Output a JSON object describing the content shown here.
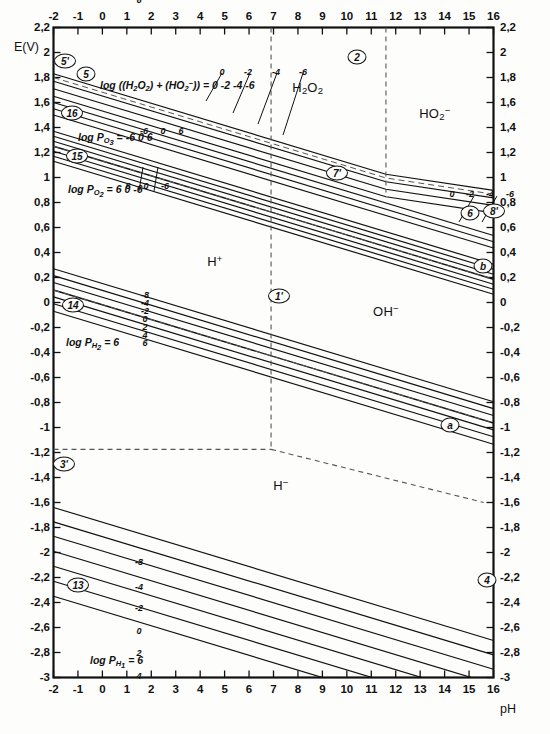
{
  "figure": {
    "kind": "pourbaix-diagram",
    "title": "",
    "background": "#fdfdfc",
    "line_color": "#111111",
    "dash_color": "#555555"
  },
  "axes": {
    "x": {
      "label": "pH",
      "min": -2,
      "max": 16,
      "ticks": [
        "-2",
        "-1",
        "0",
        "1",
        "2",
        "3",
        "4",
        "5",
        "6",
        "7",
        "8",
        "9",
        "10",
        "11",
        "12",
        "13",
        "14",
        "15",
        "16"
      ],
      "tick_values": [
        -2,
        -1,
        0,
        1,
        2,
        3,
        4,
        5,
        6,
        7,
        8,
        9,
        10,
        11,
        12,
        13,
        14,
        15,
        16
      ],
      "top_ticks": [
        "-2",
        "-1",
        "0",
        "1",
        "2",
        "3",
        "4",
        "5",
        "6",
        "7",
        "8",
        "9",
        "10",
        "11",
        "12",
        "13",
        "14",
        "15",
        "16"
      ]
    },
    "y": {
      "label": "E(V)",
      "min": -3,
      "max": 2.2,
      "ticks": [
        "2,2",
        "2",
        "1,8",
        "1,6",
        "1,4",
        "1,2",
        "1",
        "0,8",
        "0,6",
        "0,4",
        "0,2",
        "0",
        "-0,2",
        "-0,4",
        "-0,6",
        "-0,8",
        "-1",
        "-1,2",
        "-1,4",
        "-1,6",
        "-1,8",
        "-2",
        "-2,2",
        "-2,4",
        "-2,6",
        "-2,8",
        "-3"
      ],
      "tick_values": [
        2.2,
        2.0,
        1.8,
        1.6,
        1.4,
        1.2,
        1.0,
        0.8,
        0.6,
        0.4,
        0.2,
        0.0,
        -0.2,
        -0.4,
        -0.6,
        -0.8,
        -1.0,
        -1.2,
        -1.4,
        -1.6,
        -1.8,
        -2.0,
        -2.2,
        -2.4,
        -2.6,
        -2.8,
        -3.0
      ]
    }
  },
  "species_labels": [
    {
      "id": "h2o2",
      "html": "H<sub>2</sub>O<sub>2</sub>",
      "ph": 8.4,
      "e": 1.72
    },
    {
      "id": "ho2m",
      "html": "HO<sub>2</sub><sup>&minus;</sup>",
      "ph": 13.6,
      "e": 1.52
    },
    {
      "id": "hplus",
      "html": "H<sup>+</sup>",
      "ph": 4.6,
      "e": 0.33
    },
    {
      "id": "ohm",
      "html": "OH<sup>&minus;</sup>",
      "ph": 11.6,
      "e": -0.07
    },
    {
      "id": "hminus",
      "html": "H<sup>&minus;</sup>",
      "ph": 7.3,
      "e": -1.46
    }
  ],
  "curve_labels": [
    {
      "id": "log-h2o2-sum",
      "html": "log ((H<sub>2</sub>O<sub>2</sub>) + (HO<sub>2</sub><sup>&minus;</sup>)) = 0 -2 -4 -6",
      "x": 100,
      "y": 80
    },
    {
      "id": "log-po3",
      "html": "log P<sub>O<sub>3</sub></sub> = -6  0  6",
      "x": 78,
      "y": 132
    },
    {
      "id": "log-po2",
      "html": "log P<sub>O<sub>2</sub></sub> = 6  0  -6",
      "x": 68,
      "y": 184
    },
    {
      "id": "log-ph2",
      "html": "log P<sub>H<sub>2</sub></sub> = 6",
      "x": 66,
      "y": 337
    },
    {
      "id": "log-ph1",
      "html": "log P<sub>H<sub>1</sub></sub> = 6",
      "x": 90,
      "y": 655
    }
  ],
  "series_value_labels": {
    "h2o2_sum": [
      "0",
      "-2",
      "-4",
      "-6"
    ],
    "ho2_right": [
      "0",
      "-2",
      "-4",
      "-6"
    ],
    "po3": [
      "-6",
      "0",
      "6"
    ],
    "po2": [
      "6",
      "0",
      "-6"
    ],
    "ph2_stack": [
      "-8",
      "-4",
      "-2",
      "0",
      "2",
      "4",
      "6"
    ],
    "ph1_stack": [
      "-8",
      "-4",
      "-2",
      "0",
      "2",
      "4",
      "6"
    ]
  },
  "badges": [
    {
      "id": "b5p",
      "text": "5'",
      "x": 65,
      "y": 61
    },
    {
      "id": "b5",
      "text": "5",
      "x": 86,
      "y": 74
    },
    {
      "id": "b16",
      "text": "16",
      "x": 72,
      "y": 113
    },
    {
      "id": "b15",
      "text": "15",
      "x": 77,
      "y": 156
    },
    {
      "id": "b2",
      "text": "2",
      "x": 357,
      "y": 57
    },
    {
      "id": "b7p",
      "text": "7'",
      "x": 337,
      "y": 173
    },
    {
      "id": "b6",
      "text": "6",
      "x": 470,
      "y": 213
    },
    {
      "id": "b8p",
      "text": "8'",
      "x": 494,
      "y": 211
    },
    {
      "id": "bb",
      "text": "b",
      "x": 483,
      "y": 266
    },
    {
      "id": "b1p",
      "text": "1'",
      "x": 279,
      "y": 296
    },
    {
      "id": "b14",
      "text": "14",
      "x": 73,
      "y": 305
    },
    {
      "id": "ba",
      "text": "a",
      "x": 450,
      "y": 425
    },
    {
      "id": "b3p",
      "text": "3'",
      "x": 64,
      "y": 464
    },
    {
      "id": "b4",
      "text": "4",
      "x": 487,
      "y": 580
    },
    {
      "id": "b13",
      "text": "13",
      "x": 78,
      "y": 585
    }
  ],
  "chart_data": {
    "type": "line",
    "xlabel": "pH",
    "ylabel": "E(V)",
    "xlim": [
      -2,
      16
    ],
    "ylim": [
      -3,
      2.2
    ],
    "grid": false,
    "legend": "none",
    "slope_per_pH_main": -0.0591,
    "series": [
      {
        "name": "log((H2O2)+(HO2-)) = 0",
        "group": "h2o2_sum",
        "value": 0,
        "E_at_pH_minus2": 1.83,
        "slope": -0.0591,
        "kink_pH": 11.6,
        "slope_after": -0.0295
      },
      {
        "name": "log((H2O2)+(HO2-)) = -2",
        "group": "h2o2_sum",
        "value": -2,
        "E_at_pH_minus2": 1.77,
        "slope": -0.0591,
        "kink_pH": 11.6,
        "slope_after": -0.0295
      },
      {
        "name": "log((H2O2)+(HO2-)) = -4",
        "group": "h2o2_sum",
        "value": -4,
        "E_at_pH_minus2": 1.71,
        "slope": -0.0591,
        "kink_pH": 11.6,
        "slope_after": -0.0295
      },
      {
        "name": "log((H2O2)+(HO2-)) = -6",
        "group": "h2o2_sum",
        "value": -6,
        "E_at_pH_minus2": 1.65,
        "slope": -0.0591,
        "kink_pH": 11.6,
        "slope_after": -0.0295
      },
      {
        "name": "log PO3 = -6",
        "group": "po3",
        "value": -6,
        "E_at_pH_minus2": 1.6,
        "slope": -0.0591
      },
      {
        "name": "log PO3 = 0",
        "group": "po3",
        "value": 0,
        "E_at_pH_minus2": 1.55,
        "slope": -0.0591
      },
      {
        "name": "log PO3 = 6",
        "group": "po3",
        "value": 6,
        "E_at_pH_minus2": 1.5,
        "slope": -0.0591
      },
      {
        "name": "log PO2 = 6",
        "group": "po2",
        "value": 6,
        "E_at_pH_minus2": 1.37,
        "slope": -0.0591
      },
      {
        "name": "log PO2 = 4",
        "group": "po2",
        "value": 4,
        "E_at_pH_minus2": 1.33,
        "slope": -0.0591
      },
      {
        "name": "log PO2 = 2",
        "group": "po2",
        "value": 2,
        "E_at_pH_minus2": 1.29,
        "slope": -0.0591
      },
      {
        "name": "log PO2 = 0",
        "group": "po2",
        "value": 0,
        "E_at_pH_minus2": 1.25,
        "slope": -0.0591,
        "is_line_b": true
      },
      {
        "name": "log PO2 = -2",
        "group": "po2",
        "value": -2,
        "E_at_pH_minus2": 1.21,
        "slope": -0.0591
      },
      {
        "name": "log PO2 = -4",
        "group": "po2",
        "value": -4,
        "E_at_pH_minus2": 1.17,
        "slope": -0.0591
      },
      {
        "name": "log PO2 = -6",
        "group": "po2",
        "value": -6,
        "E_at_pH_minus2": 1.13,
        "slope": -0.0591
      },
      {
        "name": "log PH2 = -8",
        "group": "ph2",
        "value": -8,
        "E_at_pH_minus2": 0.27,
        "slope": -0.0591
      },
      {
        "name": "log PH2 = -4",
        "group": "ph2",
        "value": -4,
        "E_at_pH_minus2": 0.215,
        "slope": -0.0591
      },
      {
        "name": "log PH2 = -2",
        "group": "ph2",
        "value": -2,
        "E_at_pH_minus2": 0.16,
        "slope": -0.0591
      },
      {
        "name": "log PH2 = 0",
        "group": "ph2",
        "value": 0,
        "E_at_pH_minus2": 0.1,
        "slope": -0.0591,
        "is_line_a": true
      },
      {
        "name": "log PH2 = 2",
        "group": "ph2",
        "value": 2,
        "E_at_pH_minus2": 0.045,
        "slope": -0.0591
      },
      {
        "name": "log PH2 = 4",
        "group": "ph2",
        "value": 4,
        "E_at_pH_minus2": -0.01,
        "slope": -0.0591
      },
      {
        "name": "log PH2 = 6",
        "group": "ph2",
        "value": 6,
        "E_at_pH_minus2": -0.07,
        "slope": -0.0591
      },
      {
        "name": "log PH1 = -8",
        "group": "ph1",
        "value": -8,
        "E_at_pH_minus2": -1.64,
        "slope": -0.0591
      },
      {
        "name": "log PH1 = -4",
        "group": "ph1",
        "value": -4,
        "E_at_pH_minus2": -1.755,
        "slope": -0.0591
      },
      {
        "name": "log PH1 = -2",
        "group": "ph1",
        "value": -2,
        "E_at_pH_minus2": -1.87,
        "slope": -0.0591
      },
      {
        "name": "log PH1 = 0",
        "group": "ph1",
        "value": 0,
        "E_at_pH_minus2": -1.99,
        "slope": -0.0591
      },
      {
        "name": "log PH1 = 2",
        "group": "ph1",
        "value": 2,
        "E_at_pH_minus2": -2.11,
        "slope": -0.0591
      },
      {
        "name": "log PH1 = 4",
        "group": "ph1",
        "value": 4,
        "E_at_pH_minus2": -2.23,
        "slope": -0.0591
      },
      {
        "name": "log PH1 = 6",
        "group": "ph1",
        "value": 6,
        "E_at_pH_minus2": -2.35,
        "slope": -0.0591
      }
    ],
    "vertical_boundaries": [
      {
        "name": "2",
        "pH": 11.6,
        "style": "dashed",
        "E_from": 2.2,
        "E_to": 0.88
      },
      {
        "name": "1'",
        "pH": 6.9,
        "style": "dashed",
        "E_from": 2.2,
        "E_to": -1.175
      }
    ],
    "horizontal_boundaries": [
      {
        "name": "3'",
        "E": -1.175,
        "style": "dashed",
        "pH_from": -2,
        "pH_to": 6.9
      }
    ],
    "sloped_dashed_boundaries": [
      {
        "name": "4",
        "style": "dashed",
        "from": {
          "pH": 6.9,
          "E": -1.175
        },
        "to": {
          "pH": 15.6,
          "E": -1.6
        }
      }
    ],
    "region_labels": [
      {
        "text": "H2O2",
        "pH": 8.4,
        "E": 1.72
      },
      {
        "text": "HO2-",
        "pH": 13.6,
        "E": 1.52
      },
      {
        "text": "H+",
        "pH": 4.6,
        "E": 0.33
      },
      {
        "text": "OH-",
        "pH": 11.6,
        "E": -0.07
      },
      {
        "text": "H-",
        "pH": 7.3,
        "E": -1.46
      }
    ]
  }
}
